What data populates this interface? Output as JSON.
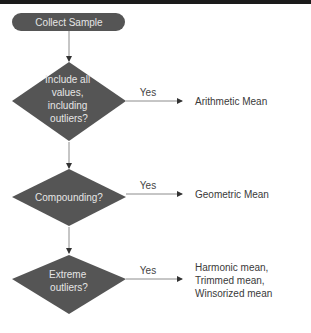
{
  "colors": {
    "node_fill": "#555555",
    "node_text": "#e6e6e6",
    "edge": "#8c8c8c",
    "arrow": "#333333",
    "label_text": "#3a3a3a",
    "top_bar": "#1b1b1b"
  },
  "start": {
    "label": "Collect Sample"
  },
  "decisions": [
    {
      "lines": [
        "Include all",
        "values,",
        "including",
        "outliers?"
      ],
      "edge_label": "Yes",
      "result_lines": [
        "Arithmetic Mean"
      ]
    },
    {
      "lines": [
        "Compounding?"
      ],
      "edge_label": "Yes",
      "result_lines": [
        "Geometric Mean"
      ]
    },
    {
      "lines": [
        "Extreme",
        "outliers?"
      ],
      "edge_label": "Yes",
      "result_lines": [
        "Harmonic mean,",
        "Trimmed mean,",
        "Winsorized mean"
      ]
    }
  ]
}
